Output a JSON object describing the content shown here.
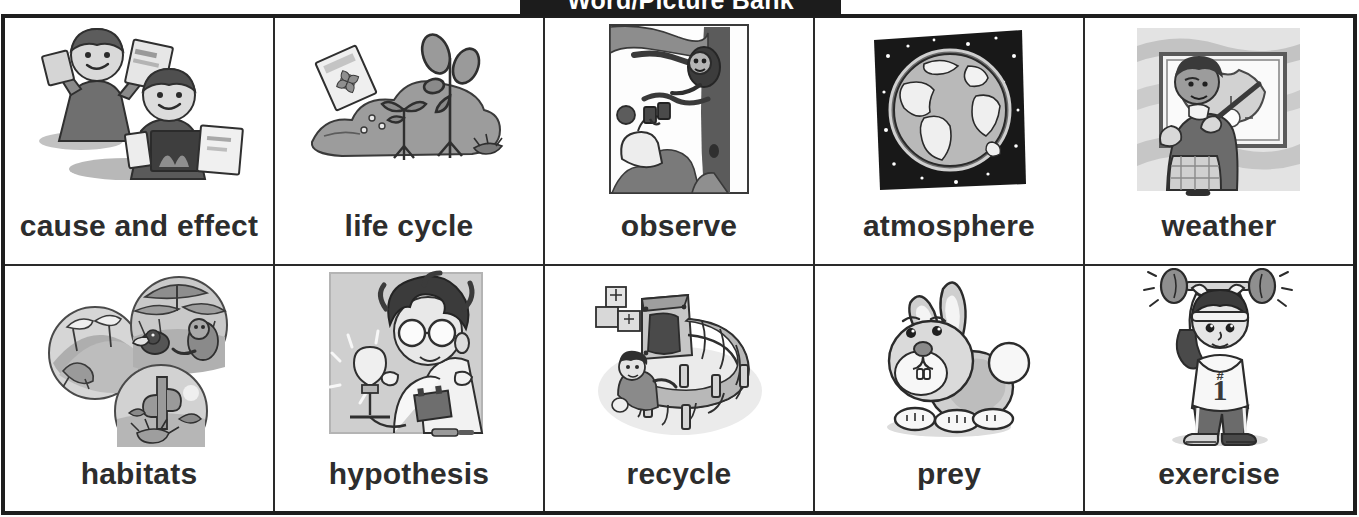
{
  "title": "Word/Picture Bank",
  "theme": {
    "page_background": "#ffffff",
    "banner_background": "#1c1c1c",
    "banner_text": "#ffffff",
    "table_border": "#1e1e1e",
    "cell_border": "#2a2a2a",
    "word_text": "#2d2d2d",
    "art_dark": "#3a3a3a",
    "art_mid": "#8c8c8c",
    "art_light": "#c9c9c9"
  },
  "table": {
    "columns": 5,
    "rows": 2,
    "cells": [
      {
        "word": "cause and effect",
        "icon": "two-children-holding-cards-icon",
        "row": 1,
        "col": 1
      },
      {
        "word": "life cycle",
        "icon": "seed-packet-sprouting-plants-icon",
        "row": 1,
        "col": 2
      },
      {
        "word": "observe",
        "icon": "person-binoculars-monkey-tree-icon",
        "row": 1,
        "col": 3
      },
      {
        "word": "atmosphere",
        "icon": "earth-globe-starry-sky-icon",
        "row": 1,
        "col": 4
      },
      {
        "word": "weather",
        "icon": "weatherman-pointing-map-icon",
        "row": 1,
        "col": 5
      },
      {
        "word": "habitats",
        "icon": "three-habitat-circles-icon",
        "row": 2,
        "col": 1
      },
      {
        "word": "hypothesis",
        "icon": "scientist-lightbulb-battery-icon",
        "row": 2,
        "col": 2
      },
      {
        "word": "recycle",
        "icon": "recycling-machine-conveyor-icon",
        "row": 2,
        "col": 3
      },
      {
        "word": "prey",
        "icon": "cartoon-rabbit-icon",
        "row": 2,
        "col": 4
      },
      {
        "word": "exercise",
        "icon": "person-lifting-dumbbells-icon",
        "row": 2,
        "col": 5
      }
    ]
  }
}
